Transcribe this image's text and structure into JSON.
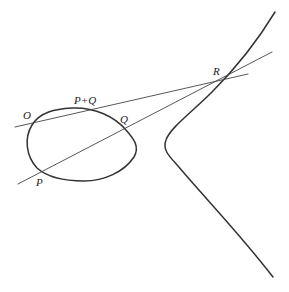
{
  "figure": {
    "labels": {
      "O": "O",
      "P": "P",
      "Q": "Q",
      "R": "R",
      "PQ": "P+Q"
    },
    "colors": {
      "curve": "#333333",
      "line": "#444444",
      "background": "#ffffff"
    }
  }
}
